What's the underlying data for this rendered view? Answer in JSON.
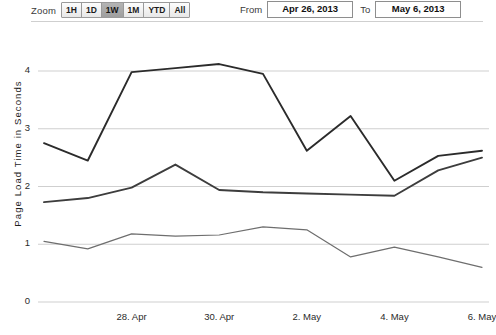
{
  "toolbar": {
    "zoom_label": "Zoom",
    "zoom_buttons": [
      {
        "label": "1H",
        "selected": false
      },
      {
        "label": "1D",
        "selected": false
      },
      {
        "label": "1W",
        "selected": true
      },
      {
        "label": "1M",
        "selected": false
      },
      {
        "label": "YTD",
        "selected": false
      },
      {
        "label": "All",
        "selected": false
      }
    ],
    "from_label": "From",
    "from_value": "Apr 26, 2013",
    "to_label": "To",
    "to_value": "May 6, 2013"
  },
  "colors": {
    "series_1": "#2b2b2b",
    "series_2": "#3d3d3d",
    "series_3": "#6e6e6e",
    "gridline": "#cfcfcf",
    "selected_button": "#a8a8a8"
  },
  "chart_data": {
    "type": "line",
    "title": "",
    "xlabel": "",
    "ylabel": "Page Load Time in Seconds",
    "ylim": [
      0,
      4.35
    ],
    "yticks": [
      0,
      1,
      2,
      3,
      4
    ],
    "ytick_labels": [
      "0",
      "1",
      "2",
      "3",
      "4"
    ],
    "xlim": [
      "Apr 26, 2013",
      "May 6, 2013"
    ],
    "xticks": [
      28,
      30,
      32,
      34,
      36
    ],
    "xtick_labels": [
      "28. Apr",
      "30. Apr",
      "2. May",
      "4. May",
      "6. May"
    ],
    "grid": true,
    "legend": "none",
    "x": [
      "Apr 26",
      "Apr 27",
      "Apr 28",
      "Apr 29",
      "Apr 30",
      "May 1",
      "May 2",
      "May 3",
      "May 4",
      "May 5",
      "May 6"
    ],
    "series": [
      {
        "name": "Series 1",
        "color": "#2b2b2b",
        "values": [
          2.75,
          2.45,
          3.98,
          4.05,
          4.12,
          3.95,
          2.62,
          3.22,
          2.1,
          2.53,
          2.62
        ]
      },
      {
        "name": "Series 2",
        "color": "#3d3d3d",
        "values": [
          1.73,
          1.8,
          1.98,
          2.38,
          1.94,
          1.9,
          1.88,
          1.86,
          1.84,
          2.28,
          2.5
        ]
      },
      {
        "name": "Series 3",
        "color": "#6e6e6e",
        "values": [
          1.05,
          0.92,
          1.18,
          1.14,
          1.16,
          1.3,
          1.25,
          0.78,
          0.95,
          0.78,
          0.6
        ]
      }
    ]
  }
}
